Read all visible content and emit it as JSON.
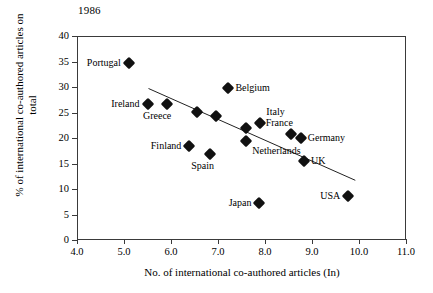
{
  "chart_data": {
    "type": "scatter",
    "title": "1986",
    "xlabel": "No. of international co-authored articles (In)",
    "ylabel": "% of international co-authored articles on total",
    "xlim": [
      4.0,
      11.0
    ],
    "ylim": [
      0,
      40
    ],
    "xticks": [
      "4.0",
      "5.0",
      "6.0",
      "7.0",
      "8.0",
      "9.0",
      "10.0",
      "11.0"
    ],
    "xtick_values": [
      4.0,
      5.0,
      6.0,
      7.0,
      8.0,
      9.0,
      10.0,
      11.0
    ],
    "yticks": [
      "0",
      "5",
      "10",
      "15",
      "20",
      "25",
      "30",
      "35",
      "40"
    ],
    "ytick_values": [
      0,
      5,
      10,
      15,
      20,
      25,
      30,
      35,
      40
    ],
    "grid": false,
    "legend": "none",
    "points": [
      {
        "label": "Portugal",
        "x": 5.08,
        "y": 34.9,
        "label_pos": "left"
      },
      {
        "label": "Ireland",
        "x": 5.48,
        "y": 26.8,
        "label_pos": "left"
      },
      {
        "label": "Greece",
        "x": 5.9,
        "y": 26.8,
        "label_pos": "below-left"
      },
      {
        "label": "",
        "x": 6.53,
        "y": 25.3,
        "label_pos": "none"
      },
      {
        "label": "",
        "x": 6.94,
        "y": 24.5,
        "label_pos": "none"
      },
      {
        "label": "Belgium",
        "x": 7.2,
        "y": 30.0,
        "label_pos": "right"
      },
      {
        "label": "Italy",
        "x": 7.88,
        "y": 23.1,
        "label_pos": "above"
      },
      {
        "label": "",
        "x": 7.57,
        "y": 22.2,
        "label_pos": "none"
      },
      {
        "label": "France",
        "x": 8.53,
        "y": 21.0,
        "label_pos": "above-left"
      },
      {
        "label": "Germany",
        "x": 8.74,
        "y": 20.1,
        "label_pos": "right"
      },
      {
        "label": "Finland",
        "x": 6.37,
        "y": 18.7,
        "label_pos": "left"
      },
      {
        "label": "Netherlands",
        "x": 7.58,
        "y": 19.7,
        "label_pos": "below-right"
      },
      {
        "label": "Spain",
        "x": 6.81,
        "y": 17.0,
        "label_pos": "below-left"
      },
      {
        "label": "UK",
        "x": 8.81,
        "y": 15.6,
        "label_pos": "right"
      },
      {
        "label": "USA",
        "x": 9.75,
        "y": 8.9,
        "label_pos": "left"
      },
      {
        "label": "Japan",
        "x": 7.86,
        "y": 7.4,
        "label_pos": "left"
      }
    ],
    "trendline": {
      "x0": 5.5,
      "y0": 29.9,
      "x1": 9.9,
      "y1": 11.9
    }
  }
}
